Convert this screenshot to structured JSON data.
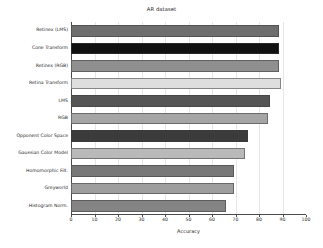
{
  "chart_data": {
    "type": "bar",
    "orientation": "horizontal",
    "title": "AR dataset",
    "xlabel": "Accuracy",
    "ylabel": "",
    "xlim": [
      0,
      100
    ],
    "xticks": [
      0,
      10,
      20,
      30,
      40,
      50,
      60,
      70,
      80,
      90,
      100
    ],
    "grid": true,
    "legend": "none",
    "categories": [
      "Retinex (LMS)",
      "Cone Transform",
      "Retinex (RGB)",
      "Retina Transform",
      "LMS",
      "RGB",
      "Opponent Color Space",
      "Gaussian Color Model",
      "Homomorphic Filt.",
      "Greyworld",
      "Histogram Norm."
    ],
    "values": [
      88.5,
      88.5,
      88.6,
      89.5,
      84.7,
      84.0,
      75.5,
      74.0,
      69.4,
      69.3,
      66.0
    ],
    "bar_colors": [
      "#6e6e6e",
      "#111111",
      "#8f8f8f",
      "#dedede",
      "#555555",
      "#a5a5a5",
      "#3b3b3b",
      "#b9b9b9",
      "#787878",
      "#9e9e9e",
      "#848484"
    ]
  },
  "figure": {
    "background": "#ffffff",
    "axis_color": "#4a4a4a",
    "grid_color": "#e6e6e6"
  }
}
